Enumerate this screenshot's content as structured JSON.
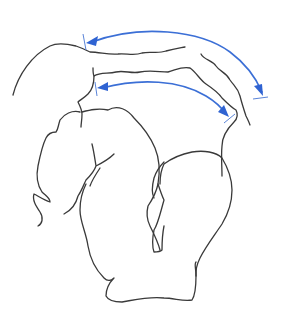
{
  "figure": {
    "type": "line-drawing",
    "width": 284,
    "height": 334,
    "background": "#ffffff",
    "colors": {
      "outline": "#3a3a3a",
      "arrow": "#3b6fd6",
      "arrowhead": "#2f63d2"
    },
    "arrows": [
      {
        "name": "upper-arrow",
        "start": [
          86,
          42
        ],
        "end": [
          264,
          96
        ]
      },
      {
        "name": "lower-arrow",
        "start": [
          97,
          88
        ],
        "end": [
          230,
          117
        ]
      }
    ]
  }
}
